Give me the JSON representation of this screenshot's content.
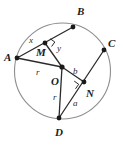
{
  "diagram": {
    "type": "geometry-circle-chords",
    "canvas": {
      "width": 123,
      "height": 145
    },
    "colors": {
      "circle_stroke": "#8e8e8e",
      "segment_stroke": "#2b2b2b",
      "point_fill": "#1a1a1a",
      "label_color": "#1c1c1c",
      "background": "#ffffff"
    },
    "circle": {
      "name": "circle-O",
      "center_x": 62.5,
      "center_y": 71,
      "radius": 48
    },
    "points": [
      {
        "id": "A",
        "label": "A",
        "x": 17,
        "y": 58,
        "on_circle": true,
        "label_x": 4,
        "label_y": 52
      },
      {
        "id": "B",
        "label": "B",
        "x": 73,
        "y": 27,
        "on_circle": true,
        "label_x": 77,
        "label_y": 6
      },
      {
        "id": "C",
        "label": "C",
        "x": 104,
        "y": 50,
        "on_circle": true,
        "label_x": 108,
        "label_y": 38
      },
      {
        "id": "D",
        "label": "D",
        "x": 59,
        "y": 118,
        "on_circle": true,
        "label_x": 55,
        "label_y": 127
      },
      {
        "id": "O",
        "label": "O",
        "x": 62,
        "y": 67,
        "on_circle": false,
        "label_x": 51,
        "label_y": 76
      },
      {
        "id": "M",
        "label": "M",
        "x": 45,
        "y": 43,
        "on_circle": false,
        "label_x": 36,
        "label_y": 47
      },
      {
        "id": "N",
        "label": "N",
        "x": 84,
        "y": 82,
        "on_circle": false,
        "label_x": 86,
        "label_y": 88
      }
    ],
    "segments": [
      {
        "name": "chord-AB",
        "from": "A",
        "to": "B"
      },
      {
        "name": "chord-CD",
        "from": "C",
        "to": "D"
      },
      {
        "name": "radius-OA",
        "from": "O",
        "to": "A"
      },
      {
        "name": "radius-OD",
        "from": "O",
        "to": "D"
      },
      {
        "name": "apothem-OM",
        "from": "O",
        "to": "M"
      },
      {
        "name": "apothem-ON",
        "from": "O",
        "to": "N"
      }
    ],
    "right_angles": [
      {
        "name": "right-angle-at-M",
        "vertex": "M",
        "size": 6
      },
      {
        "name": "right-angle-at-N",
        "vertex": "N",
        "size": 6
      }
    ],
    "measure_labels": [
      {
        "id": "x",
        "text": "x",
        "x": 29,
        "y": 36,
        "describes": "segment-AM"
      },
      {
        "id": "y",
        "text": "y",
        "x": 57,
        "y": 44,
        "describes": "segment-MB"
      },
      {
        "id": "r-upper",
        "text": "r",
        "x": 36,
        "y": 68,
        "describes": "radius-OA"
      },
      {
        "id": "r-lower",
        "text": "r",
        "x": 53,
        "y": 93,
        "describes": "radius-OD"
      },
      {
        "id": "b",
        "text": "b",
        "x": 73,
        "y": 67,
        "describes": "apothem-ON"
      },
      {
        "id": "a",
        "text": "a",
        "x": 73,
        "y": 99,
        "describes": "segment-ND"
      }
    ]
  }
}
